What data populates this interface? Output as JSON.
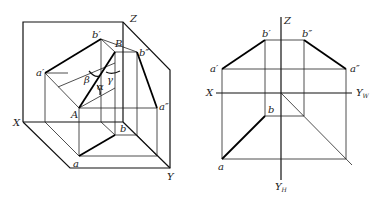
{
  "figure": {
    "left_view": {
      "title": "Pictorial view of line AB projections on three planes",
      "labels": {
        "Z": "Z",
        "X": "X",
        "Y": "Y",
        "A": "A",
        "B": "B",
        "a_prime": "a′",
        "b_prime": "b′",
        "a_dprime": "a″",
        "b_dprime": "b″",
        "a": "a",
        "b": "b",
        "alpha": "α",
        "beta": "β",
        "gamma": "γ"
      }
    },
    "right_view": {
      "title": "Orthographic projection of line AB",
      "labels": {
        "Z": "Z",
        "X": "X",
        "Yw": "Y",
        "Yw_sub": "W",
        "Yh": "Y",
        "Yh_sub": "H",
        "a_prime": "a′",
        "b_prime": "b′",
        "a_dprime": "a″",
        "b_dprime": "b″",
        "a": "a",
        "b": "b"
      }
    }
  }
}
